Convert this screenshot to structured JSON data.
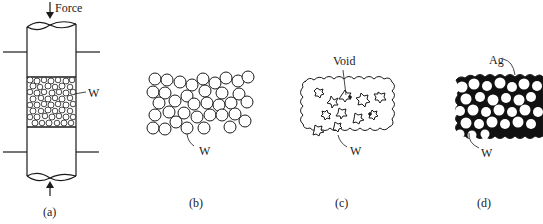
{
  "figure": {
    "panels": [
      {
        "id": "a",
        "caption": "(a)",
        "labels": {
          "force": "Force",
          "material": "W"
        }
      },
      {
        "id": "b",
        "caption": "(b)",
        "labels": {
          "material": "W"
        }
      },
      {
        "id": "c",
        "caption": "(c)",
        "labels": {
          "void": "Void",
          "material": "W"
        }
      },
      {
        "id": "d",
        "caption": "(d)",
        "labels": {
          "infiltrant": "Ag",
          "material": "W"
        }
      }
    ],
    "colors": {
      "ink": "#1a1a1a",
      "background": "#ffffff"
    }
  }
}
